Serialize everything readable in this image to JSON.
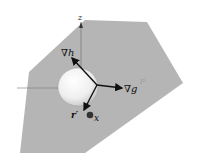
{
  "figure": {
    "labels": {
      "z_axis": "z",
      "grad_h": "∇h",
      "grad_g": "∇g",
      "r_prime": "r′",
      "x_point": "x",
      "faint_label": "P"
    },
    "colors": {
      "plane": "#b3b3b3",
      "sphere_light": "#ffffff",
      "sphere_dark": "#c8c8c8",
      "arrow": "#111111",
      "axis": "#777777",
      "point": "#333333"
    }
  }
}
